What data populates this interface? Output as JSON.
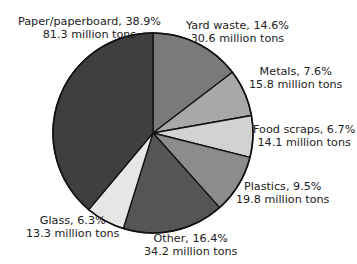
{
  "chart_data": {
    "type": "pie",
    "title": "",
    "start_angle_deg": 0,
    "direction": "clockwise",
    "slices": [
      {
        "label": "Yard waste",
        "percent": 14.6,
        "amount": "30.6 million tons",
        "value": 30.6,
        "color": "#7a7a7a"
      },
      {
        "label": "Metals",
        "percent": 7.6,
        "amount": "15.8 million tons",
        "value": 15.8,
        "color": "#a8a8a8"
      },
      {
        "label": "Food scraps",
        "percent": 6.7,
        "amount": "14.1 million tons",
        "value": 14.1,
        "color": "#d2d2d2"
      },
      {
        "label": "Plastics",
        "percent": 9.5,
        "amount": "19.8 million tons",
        "value": 19.8,
        "color": "#8c8c8c"
      },
      {
        "label": "Other",
        "percent": 16.4,
        "amount": "34.2 million tons",
        "value": 34.2,
        "color": "#555555"
      },
      {
        "label": "Glass",
        "percent": 6.3,
        "amount": "13.3 million tons",
        "value": 13.3,
        "color": "#e6e6e6"
      },
      {
        "label": "Paper/paperboard",
        "percent": 38.9,
        "amount": "81.3 million tons",
        "value": 81.3,
        "color": "#3f3f3f"
      }
    ]
  },
  "labels": {
    "paper": {
      "line1": "Paper/paperboard, 38.9%",
      "line2": "81.3 million tons"
    },
    "yard": {
      "line1": "Yard waste, 14.6%",
      "line2": "30.6 million tons"
    },
    "metals": {
      "line1": "Metals, 7.6%",
      "line2": "15.8 million tons"
    },
    "food": {
      "line1": "Food scraps, 6.7%",
      "line2": "14.1 million tons"
    },
    "plastics": {
      "line1": "Plastics, 9.5%",
      "line2": "19.8 million tons"
    },
    "other": {
      "line1": "Other, 16.4%",
      "line2": "34.2 million tons"
    },
    "glass": {
      "line1": "Glass, 6.3%",
      "line2": "13.3 million tons"
    }
  }
}
